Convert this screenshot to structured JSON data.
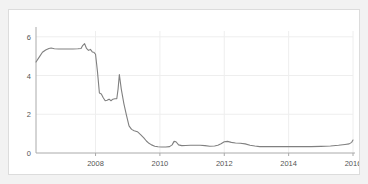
{
  "chart_data": {
    "type": "line",
    "title": "",
    "subtitle": "",
    "xlabel": "",
    "ylabel": "",
    "xlim": [
      2006.15,
      2016.0
    ],
    "ylim": [
      0,
      6.3
    ],
    "grid": true,
    "legend": false,
    "legend_position": "none",
    "line_color": "#808080",
    "background_color": "#ffffff",
    "page_background_color": "#f2f2f2",
    "border_color": "#dcdcdc",
    "gridline_color": "#eeeeee",
    "axis_color": "#aaaaaa",
    "y_ticks": [
      0,
      2,
      4,
      6
    ],
    "y_tick_labels": [
      "0",
      "2",
      "4",
      "6"
    ],
    "x_ticks": [
      2008,
      2010,
      2012,
      2014,
      2016
    ],
    "x_tick_labels": [
      "2008",
      "2010",
      "2012",
      "2014",
      "2016"
    ],
    "series": [
      {
        "name": "rate",
        "color": "#808080",
        "x": [
          2006.15,
          2006.25,
          2006.35,
          2006.45,
          2006.55,
          2006.62,
          2006.72,
          2006.85,
          2007.0,
          2007.15,
          2007.3,
          2007.45,
          2007.55,
          2007.6,
          2007.66,
          2007.72,
          2007.78,
          2007.84,
          2007.9,
          2007.95,
          2008.0,
          2008.06,
          2008.12,
          2008.18,
          2008.24,
          2008.3,
          2008.36,
          2008.42,
          2008.48,
          2008.54,
          2008.6,
          2008.66,
          2008.7,
          2008.74,
          2008.8,
          2008.88,
          2008.96,
          2009.04,
          2009.12,
          2009.2,
          2009.3,
          2009.4,
          2009.5,
          2009.58,
          2009.66,
          2009.74,
          2009.84,
          2009.94,
          2010.05,
          2010.18,
          2010.3,
          2010.38,
          2010.44,
          2010.5,
          2010.58,
          2010.68,
          2010.8,
          2010.95,
          2011.1,
          2011.25,
          2011.4,
          2011.55,
          2011.7,
          2011.8,
          2011.9,
          2012.0,
          2012.1,
          2012.22,
          2012.35,
          2012.5,
          2012.65,
          2012.8,
          2012.95,
          2013.1,
          2013.3,
          2013.55,
          2013.8,
          2014.1,
          2014.4,
          2014.7,
          2015.0,
          2015.3,
          2015.55,
          2015.75,
          2015.88,
          2015.96,
          2016.0
        ],
        "y": [
          4.7,
          4.95,
          5.2,
          5.32,
          5.4,
          5.42,
          5.38,
          5.37,
          5.37,
          5.37,
          5.37,
          5.38,
          5.4,
          5.55,
          5.65,
          5.4,
          5.3,
          5.35,
          5.22,
          5.2,
          5.1,
          4.2,
          3.1,
          3.05,
          2.85,
          2.7,
          2.72,
          2.78,
          2.7,
          2.78,
          2.8,
          2.8,
          3.3,
          4.05,
          3.3,
          2.55,
          1.95,
          1.4,
          1.22,
          1.15,
          1.1,
          0.95,
          0.78,
          0.62,
          0.5,
          0.42,
          0.35,
          0.32,
          0.31,
          0.31,
          0.33,
          0.42,
          0.6,
          0.58,
          0.42,
          0.38,
          0.39,
          0.4,
          0.4,
          0.4,
          0.38,
          0.35,
          0.36,
          0.4,
          0.48,
          0.58,
          0.6,
          0.55,
          0.52,
          0.5,
          0.47,
          0.4,
          0.36,
          0.33,
          0.33,
          0.33,
          0.33,
          0.33,
          0.33,
          0.33,
          0.34,
          0.36,
          0.4,
          0.44,
          0.47,
          0.55,
          0.67
        ]
      }
    ]
  }
}
